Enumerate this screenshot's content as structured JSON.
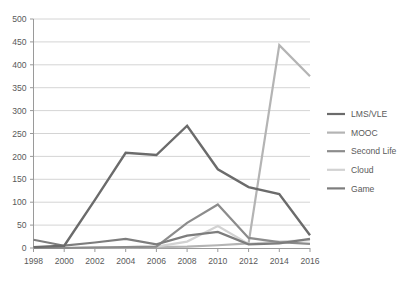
{
  "chart_data": {
    "type": "line",
    "title": "",
    "subtitle": "",
    "xlabel": "",
    "ylabel": "",
    "x": [
      1998,
      2000,
      2002,
      2004,
      2006,
      2008,
      2010,
      2012,
      2014,
      2016
    ],
    "xtick_labels": [
      "1998",
      "2000",
      "2002",
      "2004",
      "2006",
      "2008",
      "2010",
      "2012",
      "2014",
      "2016"
    ],
    "ytick_labels": [
      "0",
      "50",
      "100",
      "150",
      "200",
      "250",
      "300",
      "350",
      "400",
      "450",
      "500"
    ],
    "ytick_values": [
      0,
      50,
      100,
      150,
      200,
      250,
      300,
      350,
      400,
      450,
      500
    ],
    "ylim": [
      0,
      500
    ],
    "xlim": [
      1998,
      2016
    ],
    "grid": true,
    "grid_axis": "y",
    "legend_position": "right",
    "series": [
      {
        "name": "LMS/VLE",
        "color": "#6b6b6b",
        "width": 2.4,
        "values": [
          2,
          5,
          105,
          208,
          203,
          267,
          172,
          133,
          118,
          28
        ]
      },
      {
        "name": "MOOC",
        "color": "#b4b4b4",
        "width": 2.2,
        "values": [
          0,
          0,
          1,
          1,
          2,
          3,
          6,
          10,
          443,
          375
        ]
      },
      {
        "name": "Second Life",
        "color": "#8c8c8c",
        "width": 2.2,
        "values": [
          0,
          0,
          1,
          2,
          3,
          55,
          95,
          22,
          13,
          9
        ]
      },
      {
        "name": "Cloud",
        "color": "#d2d2d2",
        "width": 2.2,
        "values": [
          0,
          0,
          1,
          2,
          3,
          14,
          48,
          9,
          14,
          17
        ]
      },
      {
        "name": "Game",
        "color": "#7d7d7d",
        "width": 2.2,
        "values": [
          18,
          5,
          12,
          20,
          8,
          27,
          35,
          8,
          10,
          20
        ]
      }
    ]
  },
  "legend": {
    "items": [
      {
        "label": "LMS/VLE",
        "color": "#6b6b6b"
      },
      {
        "label": "MOOC",
        "color": "#b4b4b4"
      },
      {
        "label": "Second Life",
        "color": "#8c8c8c"
      },
      {
        "label": "Cloud",
        "color": "#d2d2d2"
      },
      {
        "label": "Game",
        "color": "#7d7d7d"
      }
    ]
  },
  "colors": {
    "background": "#ffffff",
    "gridline": "#c9c9c9",
    "axis": "#9a9a9a",
    "text": "#5a5a5a"
  }
}
